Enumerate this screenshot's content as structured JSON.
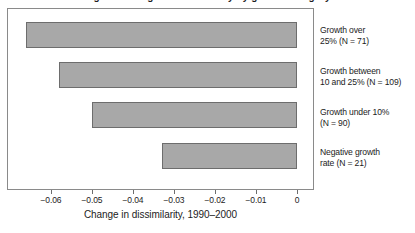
{
  "figure": {
    "title_cropped": "Figure: Change in dissimilarity by growth category",
    "axis_title": "Change in dissimilarity, 1990–2000"
  },
  "axis": {
    "ticks": [
      {
        "label": "−0.06",
        "value": -0.06
      },
      {
        "label": "−0.05",
        "value": -0.05
      },
      {
        "label": "−0.04",
        "value": -0.04
      },
      {
        "label": "−0.03",
        "value": -0.03
      },
      {
        "label": "−0.02",
        "value": -0.02
      },
      {
        "label": "−0.01",
        "value": -0.01
      },
      {
        "label": "0",
        "value": 0
      }
    ]
  },
  "categories": [
    {
      "id": "growth-over-25",
      "lines": [
        "Growth over",
        "25% (N = 71)"
      ],
      "n": 71
    },
    {
      "id": "growth-10-to-25",
      "lines": [
        "Growth between",
        "10 and 25% (N = 109)"
      ],
      "n": 109
    },
    {
      "id": "growth-under-10",
      "lines": [
        "Growth under 10%",
        "(N = 90)"
      ],
      "n": 90
    },
    {
      "id": "negative-growth",
      "lines": [
        "Negative growth",
        "rate (N = 21)"
      ],
      "n": 21
    }
  ],
  "colors": {
    "bar_fill": "#a8a8a8",
    "bar_stroke": "#6d6d6d",
    "frame": "#8a8a8a",
    "text": "#1c1c1c",
    "background": "#ffffff"
  },
  "chart_data": {
    "type": "bar",
    "orientation": "horizontal",
    "title": "",
    "xlabel": "Change in dissimilarity, 1990–2000",
    "ylabel": "",
    "xlim": [
      -0.07,
      0
    ],
    "xticks": [
      -0.06,
      -0.05,
      -0.04,
      -0.03,
      -0.02,
      -0.01,
      0
    ],
    "xtick_labels": [
      "−0.06",
      "−0.05",
      "−0.04",
      "−0.03",
      "−0.02",
      "−0.01",
      "0"
    ],
    "grid": false,
    "legend": false,
    "categories": [
      "Growth over 25% (N = 71)",
      "Growth between 10 and 25% (N = 109)",
      "Growth under 10% (N = 90)",
      "Negative growth rate (N = 21)"
    ],
    "values": [
      -0.066,
      -0.058,
      -0.05,
      -0.033
    ]
  }
}
